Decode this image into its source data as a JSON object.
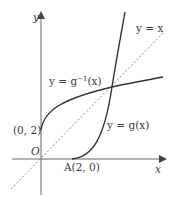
{
  "diagram": {
    "axes": {
      "x_label": "x",
      "y_label": "y",
      "origin_label": "O"
    },
    "curves": [
      {
        "name": "g",
        "label": "y = g(x)"
      },
      {
        "name": "g_inverse",
        "label_prefix": "y = g",
        "label_sup": "−1",
        "label_suffix": "(x)"
      },
      {
        "name": "identity",
        "label": "y = x",
        "style": "dashed"
      }
    ],
    "points": [
      {
        "name": "y-intercept",
        "label": "(0, 2)"
      },
      {
        "name": "A",
        "label": "A(2, 0)"
      }
    ],
    "colors": {
      "curve": "#333333",
      "axis": "#555555",
      "dashed": "#888888",
      "text": "#3a3a3a"
    }
  }
}
